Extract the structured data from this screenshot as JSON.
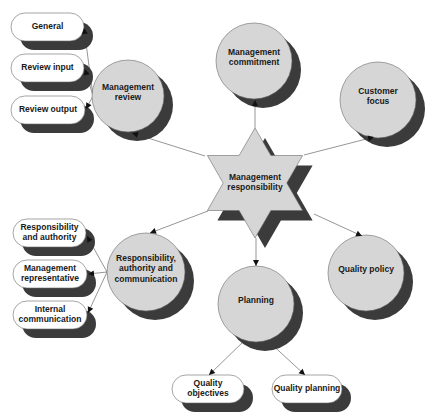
{
  "colors": {
    "node_fill": "#d6d6d6",
    "pill_fill": "#ffffff",
    "shadow": "#3b3b3b",
    "outline": "#6a6a6a",
    "connector": "#8a8a8a",
    "arrow": "#111111",
    "text": "#1a1a1a"
  },
  "center": {
    "id": "management-responsibility",
    "lines": [
      "Management",
      "responsibility"
    ]
  },
  "circles": [
    {
      "id": "management-review",
      "lines": [
        "Management",
        "review"
      ]
    },
    {
      "id": "management-commitment",
      "lines": [
        "Management",
        "commitment"
      ]
    },
    {
      "id": "customer-focus",
      "lines": [
        "Customer",
        "focus"
      ]
    },
    {
      "id": "responsibility-authority-communication",
      "lines": [
        "Responsibility,",
        "authority and",
        "communication"
      ]
    },
    {
      "id": "planning",
      "lines": [
        "Planning"
      ]
    },
    {
      "id": "quality-policy",
      "lines": [
        "Quality policy"
      ]
    }
  ],
  "pills": [
    {
      "id": "general",
      "parent": "management-review",
      "lines": [
        "General"
      ]
    },
    {
      "id": "review-input",
      "parent": "management-review",
      "lines": [
        "Review input"
      ]
    },
    {
      "id": "review-output",
      "parent": "management-review",
      "lines": [
        "Review output"
      ]
    },
    {
      "id": "responsibility-and-authority",
      "parent": "responsibility-authority-communication",
      "lines": [
        "Responsibility",
        "and authority"
      ]
    },
    {
      "id": "management-representative",
      "parent": "responsibility-authority-communication",
      "lines": [
        "Management",
        "representative"
      ]
    },
    {
      "id": "internal-communication",
      "parent": "responsibility-authority-communication",
      "lines": [
        "Internal",
        "communication"
      ]
    },
    {
      "id": "quality-objectives",
      "parent": "planning",
      "lines": [
        "Quality",
        "objectives"
      ]
    },
    {
      "id": "quality-planning",
      "parent": "planning",
      "lines": [
        "Quality planning"
      ]
    }
  ],
  "edges": [
    {
      "from": "management-responsibility",
      "to": "management-review"
    },
    {
      "from": "management-responsibility",
      "to": "management-commitment"
    },
    {
      "from": "management-responsibility",
      "to": "customer-focus"
    },
    {
      "from": "management-responsibility",
      "to": "responsibility-authority-communication"
    },
    {
      "from": "management-responsibility",
      "to": "planning"
    },
    {
      "from": "management-responsibility",
      "to": "quality-policy"
    },
    {
      "from": "management-review",
      "to": "general"
    },
    {
      "from": "management-review",
      "to": "review-input"
    },
    {
      "from": "management-review",
      "to": "review-output"
    },
    {
      "from": "responsibility-authority-communication",
      "to": "responsibility-and-authority"
    },
    {
      "from": "responsibility-authority-communication",
      "to": "management-representative"
    },
    {
      "from": "responsibility-authority-communication",
      "to": "internal-communication"
    },
    {
      "from": "planning",
      "to": "quality-objectives"
    },
    {
      "from": "planning",
      "to": "quality-planning"
    }
  ]
}
